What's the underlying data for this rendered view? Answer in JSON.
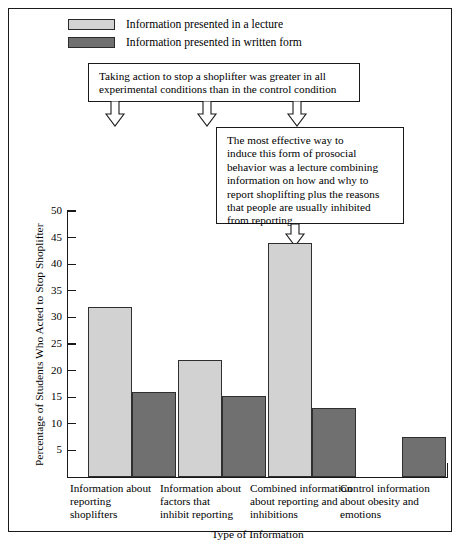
{
  "chart_data": {
    "type": "bar",
    "title": "",
    "xlabel": "Type of Information",
    "ylabel": "Percentage of Students Who Acted to Stop Shoplifter",
    "ylim": [
      0,
      50
    ],
    "yticks": [
      5,
      10,
      15,
      20,
      25,
      30,
      35,
      40,
      45,
      50
    ],
    "ytick_labels": [
      "5",
      "10",
      "15",
      "20",
      "25",
      "30",
      "35",
      "40",
      "45",
      "50"
    ],
    "grid": false,
    "legend_position": "top-left",
    "categories": [
      "Information about reporting shoplifters",
      "Information about factors that inhibit reporting",
      "Combined information about reporting and inhibitions",
      "Control information about obesity and emotions"
    ],
    "category_lines": [
      [
        "Information about",
        "reporting",
        "shoplifters"
      ],
      [
        "Information about",
        "factors that",
        "inhibit reporting"
      ],
      [
        "Combined information",
        "about reporting and",
        "inhibitions"
      ],
      [
        "Control information",
        "about obesity and",
        "emotions"
      ]
    ],
    "series": [
      {
        "name": "Information presented in a lecture",
        "color": "#d2d2d2",
        "values": [
          32,
          22,
          44,
          0
        ]
      },
      {
        "name": "Information presented in written form",
        "color": "#707070",
        "values": [
          16,
          15.3,
          13,
          7.5
        ]
      }
    ],
    "annotations": [
      "Taking action to stop a shoplifter was greater in all experimental conditions than in the control condition",
      "The most effective way to induce this form of prosocial behavior was a lecture combining information on how and why to report shoplifting plus the reasons that people are usually inhibited from reporting"
    ]
  },
  "legend": {
    "items": [
      {
        "label": "Information presented in a lecture",
        "color": "#d2d2d2"
      },
      {
        "label": "Information presented in written form",
        "color": "#707070"
      }
    ]
  },
  "callouts": {
    "first": {
      "lines": [
        "Taking action to stop a shoplifter was greater in all",
        "experimental conditions than in the control condition"
      ]
    },
    "second": {
      "lines": [
        "The most effective way to",
        "induce this form of prosocial",
        "behavior was a lecture combining",
        "information on how and why to",
        "report shoplifting plus the reasons",
        "that people are usually inhibited",
        "from reporting"
      ]
    }
  },
  "axes": {
    "y_title": "Percentage of Students Who Acted to Stop Shoplifter",
    "x_title": "Type of Information"
  }
}
